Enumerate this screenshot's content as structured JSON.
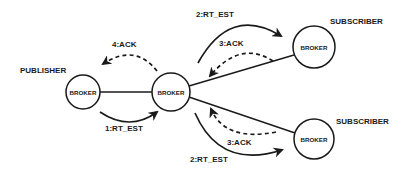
{
  "diagram": {
    "roles": {
      "publisher": "PUBLISHER",
      "subscriber_top": "SUBSCRIBER",
      "subscriber_bottom": "SUBSCRIBER"
    },
    "nodes": {
      "publisher_broker": "BROKER",
      "central_broker": "BROKER",
      "subscriber_top_broker": "BROKER",
      "subscriber_bottom_broker": "BROKER"
    },
    "messages": {
      "step1": "1:RT_EST",
      "step2_top": "2:RT_EST",
      "step2_bottom": "2:RT_EST",
      "step3_top": "3:ACK",
      "step3_bottom": "3:ACK",
      "step4": "4:ACK"
    },
    "colors": {
      "ink": "#1a1a1a",
      "background": "#ffffff"
    }
  }
}
